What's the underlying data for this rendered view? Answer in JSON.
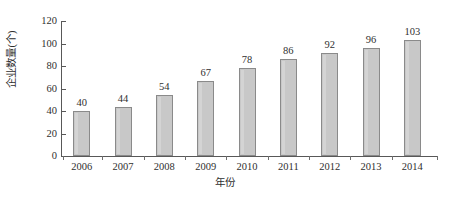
{
  "chart_data": {
    "type": "bar",
    "title": "",
    "subtitle": "",
    "xlabel": "年份",
    "ylabel": "企业数量(个)",
    "categories": [
      "2006",
      "2007",
      "2008",
      "2009",
      "2010",
      "2011",
      "2012",
      "2013",
      "2014"
    ],
    "values": [
      40,
      44,
      54,
      67,
      78,
      86,
      92,
      96,
      103
    ],
    "value_labels": [
      "40",
      "44",
      "54",
      "67",
      "78",
      "86",
      "92",
      "96",
      "103"
    ],
    "ylim": [
      0,
      120
    ],
    "ytick_labels": [
      "0",
      "20",
      "40",
      "60",
      "80",
      "100",
      "120"
    ],
    "ytick_values": [
      0,
      20,
      40,
      60,
      80,
      100,
      120
    ],
    "grid": false,
    "legend": null,
    "legend_position": "none",
    "bar_fill_color": "#c8c8c8",
    "bar_border_color": "#8a8a8a",
    "axis_color": "#585858",
    "text_color": "#2f2f2f",
    "background_color": "#ffffff"
  }
}
